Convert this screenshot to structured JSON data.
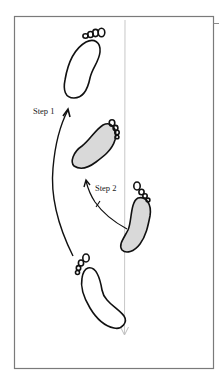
{
  "diagram": {
    "title": "",
    "labels": {
      "step1": "Step 1",
      "step2": "Step 2"
    },
    "colors": {
      "frame": "#7a7a7a",
      "outline": "#111111",
      "shaded_fill": "#d9d9d9",
      "centerline": "#c8c8c8",
      "background": "#ffffff"
    },
    "elements": [
      {
        "id": "footprint-top",
        "shaded": false,
        "description": "upper foot outline, toes pointing up-right"
      },
      {
        "id": "footprint-middle",
        "shaded": true,
        "description": "middle shaded foot, toes pointing up-right"
      },
      {
        "id": "footprint-right",
        "shaded": true,
        "description": "right shaded foot, toes pointing up-left"
      },
      {
        "id": "footprint-bottom",
        "shaded": false,
        "description": "lower foot outline, toes pointing up-left"
      },
      {
        "id": "arrow-step1",
        "description": "long curved arrow from bottom foot up to top foot"
      },
      {
        "id": "arrow-step2",
        "description": "short curved arrow with tick from right foot to middle foot"
      },
      {
        "id": "centerline",
        "description": "thin gray vertical line with downward arrowhead"
      }
    ]
  }
}
